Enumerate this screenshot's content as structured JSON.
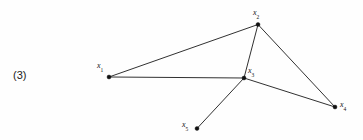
{
  "figure": {
    "caption_number": "(3)",
    "background_color": "#fefefe",
    "line_color": "#1a1a1a",
    "node_color": "#111111",
    "width": 363,
    "height": 140
  },
  "nodes": [
    {
      "id": "x1",
      "base": "x",
      "subscript": "1",
      "label_text": "x1",
      "cx": 109,
      "cy": 77,
      "r": 2.0,
      "label_x": 97,
      "label_y": 62
    },
    {
      "id": "x2",
      "base": "x",
      "subscript": "2",
      "label_text": "x2",
      "cx": 258,
      "cy": 24.5,
      "r": 2.0,
      "label_x": 253,
      "label_y": 9
    },
    {
      "id": "x3",
      "base": "x",
      "subscript": "3",
      "label_text": "x3",
      "cx": 244,
      "cy": 78,
      "r": 2.0,
      "label_x": 248,
      "label_y": 67
    },
    {
      "id": "x4",
      "base": "x",
      "subscript": "4",
      "label_text": "x4",
      "cx": 335,
      "cy": 107,
      "r": 2.0,
      "label_x": 340,
      "label_y": 101
    },
    {
      "id": "x5",
      "base": "x",
      "subscript": "5",
      "label_text": "x5",
      "cx": 197,
      "cy": 128.5,
      "r": 2.0,
      "label_x": 182,
      "label_y": 121
    }
  ],
  "edges": [
    {
      "id": "x1-x2",
      "from": "x1",
      "to": "x2",
      "x1": 109,
      "y1": 77,
      "x2": 258,
      "y2": 24.5
    },
    {
      "id": "x1-x3",
      "from": "x1",
      "to": "x3",
      "x1": 109,
      "y1": 77,
      "x2": 244,
      "y2": 78
    },
    {
      "id": "x2-x3",
      "from": "x2",
      "to": "x3",
      "x1": 258,
      "y1": 24.5,
      "x2": 244,
      "y2": 78
    },
    {
      "id": "x2-x4",
      "from": "x2",
      "to": "x4",
      "x1": 258,
      "y1": 24.5,
      "x2": 335,
      "y2": 107
    },
    {
      "id": "x3-x4",
      "from": "x3",
      "to": "x4",
      "x1": 244,
      "y1": 78,
      "x2": 335,
      "y2": 107
    },
    {
      "id": "x3-x5",
      "from": "x3",
      "to": "x5",
      "x1": 244,
      "y1": 78,
      "x2": 197,
      "y2": 128.5
    }
  ],
  "caption": {
    "text": "(3)",
    "x": 13,
    "y": 70
  }
}
